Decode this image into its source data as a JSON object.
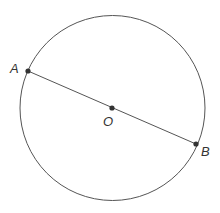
{
  "diagram": {
    "type": "circle-with-diameter",
    "circle": {
      "cx": 112,
      "cy": 108,
      "r": 94,
      "stroke": "#555555"
    },
    "points": {
      "A": {
        "label": "A",
        "x": 28,
        "y": 71
      },
      "O": {
        "label": "O",
        "x": 112,
        "y": 108
      },
      "B": {
        "label": "B",
        "x": 196,
        "y": 144
      }
    },
    "segment": {
      "from": "A",
      "to": "B",
      "stroke": "#555555"
    },
    "dot_color": "#333333"
  }
}
